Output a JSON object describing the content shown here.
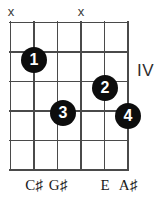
{
  "diagram": {
    "type": "guitar-chord-diagram",
    "position_label": "IV",
    "strings": 6,
    "frets": 5,
    "colors": {
      "dot": "#0d0d0d",
      "dot_text": "#ffffff",
      "grid": "#4a4a4a",
      "text": "#1a1a1a",
      "mute": "#3a3a3a"
    },
    "mute_markers": [
      {
        "label": "x",
        "string": 1,
        "x": 11,
        "y": 5
      },
      {
        "label": "x",
        "string": 4,
        "x": 81,
        "y": 5
      }
    ],
    "fingerings": [
      {
        "finger": "1",
        "string": 2,
        "cx": 34,
        "cy": 60,
        "r": 13
      },
      {
        "finger": "2",
        "string": 5,
        "cx": 105,
        "cy": 88,
        "r": 13
      },
      {
        "finger": "3",
        "string": 3,
        "cx": 63,
        "cy": 113,
        "r": 13
      },
      {
        "finger": "4",
        "string": 6,
        "cx": 128,
        "cy": 116,
        "r": 13
      }
    ],
    "note_labels": [
      {
        "text": "C♯",
        "x": 34,
        "y": 178
      },
      {
        "text": "G♯",
        "x": 58,
        "y": 178
      },
      {
        "text": "E",
        "x": 105,
        "y": 178
      },
      {
        "text": "A♯",
        "x": 128,
        "y": 178
      }
    ]
  }
}
